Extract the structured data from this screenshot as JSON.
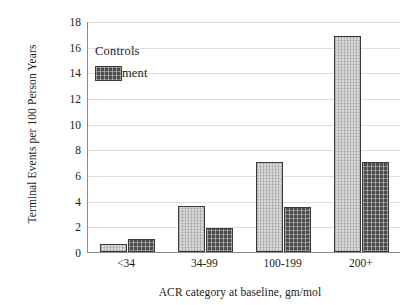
{
  "chart_data": {
    "type": "bar",
    "title": "",
    "xlabel": "ACR category at baseline, gm/mol",
    "ylabel": "Terminal Events per 100 Person Years",
    "categories": [
      "<34",
      "34-99",
      "100-199",
      "200+"
    ],
    "series": [
      {
        "name": "Controls",
        "values": [
          0.6,
          3.6,
          7.0,
          16.8
        ],
        "color": "#d9d9d9"
      },
      {
        "name": "Treatment",
        "values": [
          1.0,
          1.85,
          3.5,
          7.0
        ],
        "color": "#4d4d4d"
      }
    ],
    "ylim": [
      0,
      18
    ],
    "yticks": [
      0,
      2,
      4,
      6,
      8,
      10,
      12,
      14,
      16,
      18
    ],
    "ytick_labels": [
      "0",
      "2",
      "4",
      "6",
      "8",
      "10",
      "12",
      "14",
      "16",
      "18"
    ],
    "grid": true,
    "grid_axis": "y",
    "legend_position": "upper left",
    "legend_entries": [
      "Controls",
      "Treatment"
    ]
  }
}
